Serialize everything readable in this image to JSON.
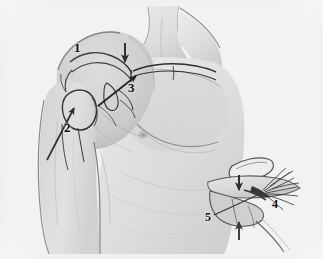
{
  "figure": {
    "domain": "medical-anatomical-illustration",
    "style": "grayscale pencil/wash drawing",
    "background_color": "#efefef",
    "ink_color": "#101010",
    "width": 323,
    "height": 259,
    "views": [
      {
        "id": "main-view",
        "name": "main-anterior-shoulder-view",
        "description": "Anterior view of right shoulder and upper chest with arm at side; bony outlines of clavicle, acromion, coracoid and humeral head drawn over the skin surface"
      },
      {
        "id": "inset-view",
        "name": "inset-detail-view",
        "description": "Lower-right magnified detail showing torn frayed ligament fibers between clavicle and coracoid",
        "position": "bottom-right"
      }
    ],
    "labels": [
      {
        "id": "1",
        "text": "1",
        "view": "main-view",
        "x": 74,
        "y": 41,
        "has_arrow": false,
        "refers_to": "acromion / lateral shoulder contour"
      },
      {
        "id": "2",
        "text": "2",
        "view": "main-view",
        "x": 64,
        "y": 121,
        "has_arrow": true,
        "arrow_direction": "up-right",
        "refers_to": "humeral head / glenohumeral joint"
      },
      {
        "id": "3",
        "text": "3",
        "view": "main-view",
        "x": 128,
        "y": 81,
        "has_arrow": true,
        "arrow_direction": "up-right",
        "refers_to": "distal clavicle / acromioclavicular joint"
      },
      {
        "id": "4",
        "text": "4",
        "view": "inset-view",
        "x": 272,
        "y": 198,
        "has_arrow": false,
        "refers_to": "frayed torn ligament fibers"
      },
      {
        "id": "5",
        "text": "5",
        "view": "inset-view",
        "x": 205,
        "y": 211,
        "has_arrow": true,
        "arrow_direction": "up-right",
        "refers_to": "coracoid process"
      }
    ],
    "arrows": [
      {
        "id": "arrow-down-main",
        "name": "down-arrow-clavicle",
        "view": "main-view",
        "from": [
          125,
          43
        ],
        "to": [
          125,
          62
        ],
        "direction": "down"
      },
      {
        "id": "arrow-3",
        "name": "leader-arrow-3",
        "view": "main-view",
        "from": [
          98,
          106
        ],
        "to": [
          136,
          76
        ],
        "direction": "up-right"
      },
      {
        "id": "arrow-2",
        "name": "leader-arrow-2",
        "view": "main-view",
        "from": [
          47,
          160
        ],
        "to": [
          74,
          108
        ],
        "direction": "up-right"
      },
      {
        "id": "arrow-down-inset",
        "name": "down-arrow-inset",
        "view": "inset-view",
        "from": [
          239,
          175
        ],
        "to": [
          239,
          189
        ],
        "direction": "down"
      },
      {
        "id": "arrow-up-inset",
        "name": "up-arrow-inset",
        "view": "inset-view",
        "from": [
          239,
          238
        ],
        "to": [
          239,
          221
        ],
        "direction": "up"
      },
      {
        "id": "arrow-5",
        "name": "leader-line-5",
        "view": "inset-view",
        "from": [
          214,
          215
        ],
        "to": [
          262,
          193
        ],
        "direction": "up-right"
      }
    ]
  }
}
